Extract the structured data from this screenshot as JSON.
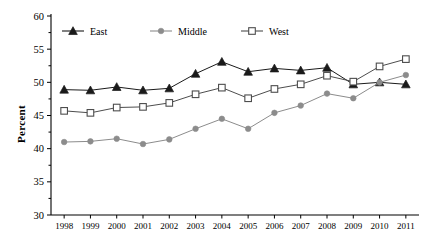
{
  "chart_data": {
    "type": "line",
    "title": "",
    "xlabel": "",
    "ylabel": "Percent",
    "categories": [
      "1998",
      "1999",
      "2000",
      "2001",
      "2002",
      "2003",
      "2004",
      "2005",
      "2006",
      "2007",
      "2008",
      "2009",
      "2010",
      "2011"
    ],
    "ylim": [
      30,
      60
    ],
    "yticks": [
      30,
      35,
      40,
      45,
      50,
      55,
      60
    ],
    "grid": false,
    "legend_position": "top-inside",
    "series": [
      {
        "name": "East",
        "marker": "triangle-filled",
        "color": "#1a1a1a",
        "values": [
          48.9,
          48.8,
          49.3,
          48.8,
          49.1,
          51.3,
          53.1,
          51.6,
          52.1,
          51.8,
          52.2,
          49.7,
          50.0,
          49.7
        ]
      },
      {
        "name": "Middle",
        "marker": "circle-filled",
        "color": "#8c8c8c",
        "values": [
          41.0,
          41.1,
          41.5,
          40.7,
          41.4,
          43.0,
          44.5,
          43.0,
          45.4,
          46.5,
          48.3,
          47.6,
          50.0,
          51.1
        ]
      },
      {
        "name": "West",
        "marker": "square-open",
        "color": "#4d4d4d",
        "values": [
          45.7,
          45.4,
          46.2,
          46.3,
          46.9,
          48.2,
          49.2,
          47.6,
          49.0,
          49.7,
          51.0,
          50.1,
          52.4,
          53.5
        ]
      }
    ]
  },
  "legend": {
    "items": [
      {
        "label": "East"
      },
      {
        "label": "Middle"
      },
      {
        "label": "West"
      }
    ]
  },
  "axis": {
    "y_label": "Percent"
  }
}
